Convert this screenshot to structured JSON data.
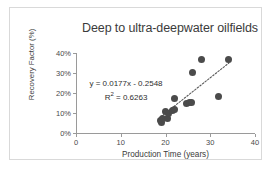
{
  "chart_data": {
    "type": "scatter",
    "title": "Deep to ultra-deepwater oilfields",
    "xlabel": "Production Time (years)",
    "ylabel": "Recovery Factor (%)",
    "xlim": [
      0,
      40
    ],
    "ylim": [
      0,
      40
    ],
    "xticks": [
      "0",
      "10",
      "20",
      "30",
      "40"
    ],
    "xtick_values": [
      0,
      10,
      20,
      30,
      40
    ],
    "yticks": [
      "0%",
      "10%",
      "20%",
      "30%",
      "40%"
    ],
    "ytick_values": [
      0,
      10,
      20,
      30,
      40
    ],
    "grid": false,
    "legend": false,
    "points": [
      {
        "x": 18.9,
        "y": 6.2
      },
      {
        "x": 19.1,
        "y": 5.3
      },
      {
        "x": 19.3,
        "y": 7.4
      },
      {
        "x": 20.0,
        "y": 10.6
      },
      {
        "x": 20.4,
        "y": 7.3
      },
      {
        "x": 20.7,
        "y": 9.6
      },
      {
        "x": 21.6,
        "y": 11.4
      },
      {
        "x": 22.0,
        "y": 11.6
      },
      {
        "x": 22.0,
        "y": 17.2
      },
      {
        "x": 24.6,
        "y": 14.9
      },
      {
        "x": 25.3,
        "y": 15.2
      },
      {
        "x": 25.7,
        "y": 15.3
      },
      {
        "x": 26.0,
        "y": 30.3
      },
      {
        "x": 28.0,
        "y": 36.8
      },
      {
        "x": 31.9,
        "y": 18.2
      },
      {
        "x": 34.0,
        "y": 37.0
      }
    ],
    "trendline": {
      "style": "dotted",
      "equation": "y = 0.0177x - 0.2548",
      "r_squared_label": "R",
      "r_squared_sup": "2",
      "r_squared_value": " = 0.6263",
      "slope": 0.0177,
      "intercept": -0.2548,
      "r_squared": 0.6263,
      "x_start": 19.0,
      "x_end": 34.2
    },
    "colors": {
      "marker": "#4b4b4b",
      "axis": "#9a9a9a",
      "text": "#3b3b3b",
      "trendline": "#5a5a5a",
      "frame": "#d9d9d9"
    }
  }
}
